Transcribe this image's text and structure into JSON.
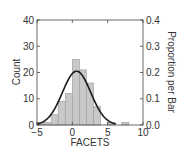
{
  "chart_data": {
    "type": "bar",
    "title": "",
    "xlabel": "FACETS",
    "ylabel": "Count",
    "ylabel_right": "Proportion per Bar",
    "xlim": [
      -5,
      10
    ],
    "ylim": [
      0,
      40
    ],
    "ylim_right": [
      0.0,
      0.4
    ],
    "x_ticks": [
      "-5",
      "0",
      "5",
      "10"
    ],
    "y_ticks": [
      "0",
      "10",
      "20",
      "30",
      "40"
    ],
    "y_ticks_right": [
      "0.0",
      "0.1",
      "0.2",
      "0.3",
      "0.4"
    ],
    "bin_width": 1,
    "bins": [
      {
        "start": -5,
        "end": -4,
        "count": 1
      },
      {
        "start": -4,
        "end": -3,
        "count": 1
      },
      {
        "start": -3,
        "end": -2,
        "count": 4
      },
      {
        "start": -2,
        "end": -1,
        "count": 9
      },
      {
        "start": -1,
        "end": 0,
        "count": 12
      },
      {
        "start": 0,
        "end": 1,
        "count": 25
      },
      {
        "start": 1,
        "end": 2,
        "count": 21
      },
      {
        "start": 2,
        "end": 3,
        "count": 16
      },
      {
        "start": 3,
        "end": 4,
        "count": 7
      },
      {
        "start": 4,
        "end": 5,
        "count": 0
      },
      {
        "start": 5,
        "end": 6,
        "count": 1
      },
      {
        "start": 6,
        "end": 7,
        "count": 0
      },
      {
        "start": 7,
        "end": 8,
        "count": 1
      }
    ],
    "overlay": {
      "type": "normal_curve",
      "mean": 0.6,
      "sd": 2.0,
      "peak_count": 20.5
    },
    "grid": false,
    "legend": null
  },
  "colors": {
    "bar_fill": "#c8c8c8",
    "bar_stroke": "#9a9a9a",
    "curve": "#1a1a1a",
    "axis": "#444444"
  }
}
